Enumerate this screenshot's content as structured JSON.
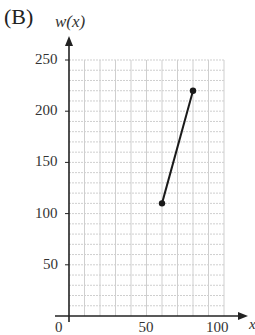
{
  "panel_label": "(B)",
  "chart_data": {
    "type": "line",
    "title": "",
    "xlabel": "x",
    "ylabel": "w(x)",
    "xlim": [
      0,
      100
    ],
    "ylim": [
      0,
      250
    ],
    "grid": true,
    "x_grid_step": 10,
    "y_grid_step": 10,
    "x_ticks": [
      0,
      50,
      100
    ],
    "y_ticks": [
      50,
      100,
      150,
      200,
      250
    ],
    "x_tick_labels": [
      "0",
      "50",
      "100"
    ],
    "y_tick_labels": [
      "50",
      "100",
      "150",
      "200",
      "250"
    ],
    "series": [
      {
        "name": "w(x)",
        "x": [
          60,
          80
        ],
        "y": [
          110,
          220
        ],
        "endpoints": "closed",
        "color": "#1a1a1a"
      }
    ],
    "legend": null
  },
  "colors": {
    "axis": "#222222",
    "grid": "#cfcfcf",
    "line": "#1a1a1a"
  }
}
